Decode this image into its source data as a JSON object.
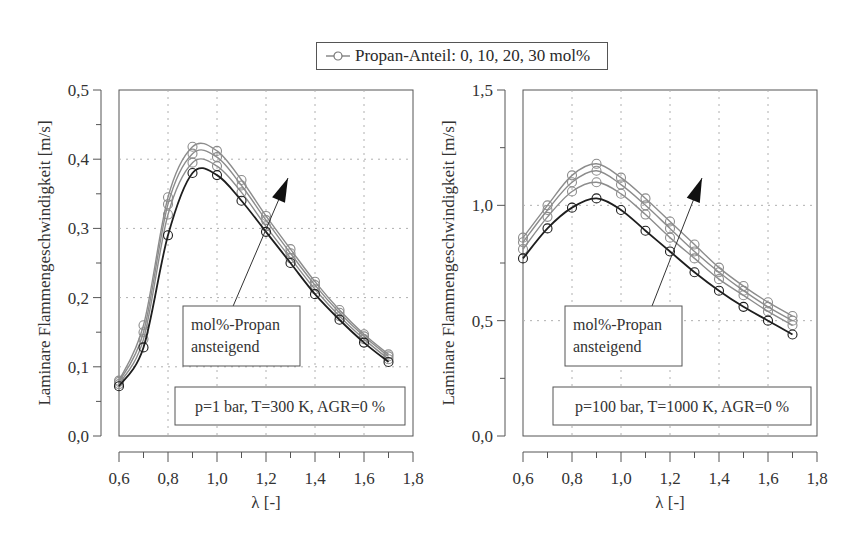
{
  "legend": {
    "marker_icon": "line-circle-marker",
    "label": "Propan-Anteil: 0, 10, 20, 30 mol%"
  },
  "colors": {
    "series_0": "#1e1e1e",
    "series_other": "#8c8c8c",
    "grid": "#b0b0b0",
    "axis": "#555555"
  },
  "chart_data": [
    {
      "type": "line",
      "title": "",
      "xlabel": "λ [-]",
      "ylabel": "Laminare Flammengeschwindigkeit [m/s]",
      "xlim": [
        0.6,
        1.8
      ],
      "ylim": [
        0.0,
        0.5
      ],
      "xticks": [
        "0,6",
        "0,8",
        "1,0",
        "1,2",
        "1,4",
        "1,6",
        "1,8"
      ],
      "yticks": [
        "0,0",
        "0,1",
        "0,2",
        "0,3",
        "0,4",
        "0,5"
      ],
      "grid": true,
      "legend_position": "top-center",
      "x": [
        0.6,
        0.7,
        0.8,
        0.9,
        1.0,
        1.1,
        1.2,
        1.3,
        1.4,
        1.5,
        1.6,
        1.7
      ],
      "series": [
        {
          "name": "0 mol% Propan",
          "values": [
            0.072,
            0.128,
            0.29,
            0.38,
            0.377,
            0.34,
            0.295,
            0.25,
            0.205,
            0.168,
            0.135,
            0.107
          ]
        },
        {
          "name": "10 mol% Propan",
          "values": [
            0.075,
            0.14,
            0.32,
            0.395,
            0.39,
            0.352,
            0.303,
            0.257,
            0.212,
            0.173,
            0.14,
            0.111
          ]
        },
        {
          "name": "20 mol% Propan",
          "values": [
            0.078,
            0.15,
            0.335,
            0.408,
            0.403,
            0.362,
            0.312,
            0.264,
            0.218,
            0.178,
            0.144,
            0.115
          ]
        },
        {
          "name": "30 mol% Propan",
          "values": [
            0.08,
            0.16,
            0.345,
            0.418,
            0.412,
            0.37,
            0.318,
            0.27,
            0.223,
            0.182,
            0.147,
            0.118
          ]
        }
      ],
      "annotations": {
        "arrow_label": [
          "mol%-Propan",
          "ansteigend"
        ],
        "conditions": "p=1 bar, T=300 K, AGR=0 %"
      }
    },
    {
      "type": "line",
      "title": "",
      "xlabel": "λ [-]",
      "ylabel": "Laminare Flammengeschwindigkeit [m/s]",
      "xlim": [
        0.6,
        1.8
      ],
      "ylim": [
        0.0,
        1.5
      ],
      "xticks": [
        "0,6",
        "0,8",
        "1,0",
        "1,2",
        "1,4",
        "1,6",
        "1,8"
      ],
      "yticks": [
        "0,0",
        "0,5",
        "1,0",
        "1,5"
      ],
      "grid": true,
      "legend_position": "top-center",
      "x": [
        0.6,
        0.7,
        0.8,
        0.9,
        1.0,
        1.1,
        1.2,
        1.3,
        1.4,
        1.5,
        1.6,
        1.7
      ],
      "series": [
        {
          "name": "0 mol% Propan",
          "values": [
            0.77,
            0.9,
            0.99,
            1.03,
            0.98,
            0.89,
            0.8,
            0.71,
            0.63,
            0.56,
            0.5,
            0.44
          ]
        },
        {
          "name": "10 mol% Propan",
          "values": [
            0.81,
            0.95,
            1.06,
            1.1,
            1.05,
            0.96,
            0.86,
            0.77,
            0.68,
            0.61,
            0.54,
            0.48
          ]
        },
        {
          "name": "20 mol% Propan",
          "values": [
            0.84,
            0.98,
            1.1,
            1.15,
            1.09,
            1.0,
            0.9,
            0.8,
            0.71,
            0.63,
            0.56,
            0.5
          ]
        },
        {
          "name": "30 mol% Propan",
          "values": [
            0.86,
            1.0,
            1.13,
            1.18,
            1.12,
            1.03,
            0.93,
            0.83,
            0.73,
            0.65,
            0.58,
            0.52
          ]
        }
      ],
      "annotations": {
        "arrow_label": [
          "mol%-Propan",
          "ansteigend"
        ],
        "conditions": "p=100 bar, T=1000 K, AGR=0 %"
      }
    }
  ]
}
